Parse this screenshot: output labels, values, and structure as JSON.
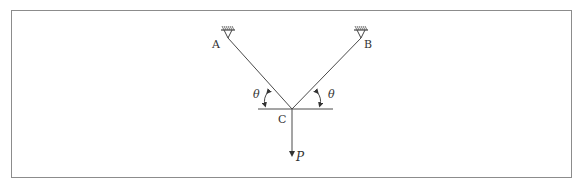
{
  "diagram": {
    "type": "two-cable support with hanging load",
    "labels": {
      "support_left": "A",
      "support_right": "B",
      "joint": "C",
      "angle_left": "θ",
      "angle_right": "θ",
      "load": "P"
    },
    "colors": {
      "line": "#4a4a4a",
      "frame": "#8c8c8c",
      "background": "#ffffff"
    }
  }
}
